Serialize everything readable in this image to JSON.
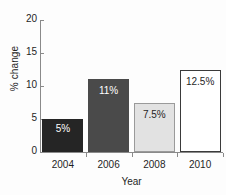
{
  "chart_data": {
    "type": "bar",
    "title": "",
    "subtitle": "",
    "xlabel": "Year",
    "ylabel": "% change",
    "categories": [
      "2004",
      "2006",
      "2008",
      "2010"
    ],
    "values": [
      5,
      11,
      7.5,
      12.5
    ],
    "data_labels": [
      "5%",
      "11%",
      "7.5%",
      "12.5%"
    ],
    "ylim": [
      0,
      20
    ],
    "yticks": [
      0,
      5,
      10,
      15,
      20
    ],
    "ytick_labels": [
      "0",
      "5",
      "10",
      "15",
      "20"
    ],
    "grid": false,
    "legend": false,
    "legend_position": "none",
    "bar_fills": [
      "#252525",
      "#4a4a4a",
      "#e2e2e2",
      "#ffffff"
    ],
    "bar_borders": [
      "#252525",
      "#4a4a4a",
      "#9a9a9a",
      "#3a3a3a"
    ],
    "label_colors": [
      "#ffffff",
      "#ffffff",
      "#1f1f1f",
      "#1f1f1f"
    ],
    "label_positions": [
      "inside-bottom",
      "inside-top",
      "inside-top",
      "inside-top"
    ],
    "series": [
      {
        "name": "% change",
        "values": [
          5,
          11,
          7.5,
          12.5
        ]
      }
    ],
    "axis_color": "#8a8a8a",
    "background": "#fdfdfd"
  }
}
